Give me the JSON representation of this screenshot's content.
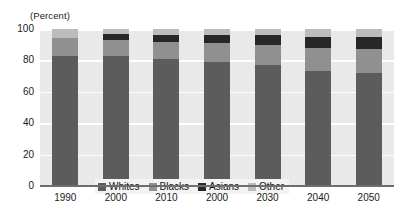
{
  "chart_data": {
    "type": "bar",
    "stacked": true,
    "title": "",
    "subtitle": "",
    "xlabel": "",
    "ylabel": "(Percent)",
    "ylim": [
      0,
      100
    ],
    "yticks": [
      0,
      20,
      40,
      60,
      80,
      100
    ],
    "ytick_labels": [
      "0",
      "20",
      "40",
      "60",
      "80",
      "100"
    ],
    "grid": "horizontal",
    "legend_position": "inside-lower-left",
    "categories": [
      "1990",
      "2000",
      "2010",
      "2000",
      "2030",
      "2040",
      "2050"
    ],
    "series": [
      {
        "name": "Whites",
        "color": "#5c5c5c",
        "values": [
          83,
          83,
          81,
          79,
          77,
          73,
          72
        ]
      },
      {
        "name": "Blacks",
        "color": "#909090",
        "values": [
          11,
          10,
          11,
          12,
          13,
          15,
          15
        ]
      },
      {
        "name": "Asians",
        "color": "#272727",
        "values": [
          0,
          4,
          4,
          5,
          6,
          7,
          8
        ]
      },
      {
        "name": "Other",
        "color": "#bcbcbc",
        "values": [
          6,
          3,
          4,
          4,
          4,
          5,
          5
        ]
      }
    ]
  },
  "axis": {
    "unit_caption": "(Percent)"
  },
  "legend": {
    "entries": [
      {
        "label": "Whites",
        "color": "#5c5c5c"
      },
      {
        "label": "Blacks",
        "color": "#909090"
      },
      {
        "label": "Asians",
        "color": "#272727"
      },
      {
        "label": "Other",
        "color": "#bcbcbc"
      }
    ]
  },
  "colors": {
    "panel_background": "#e9e9e9",
    "gridline": "#ffffff",
    "axis_line": "#6e6e6e",
    "text": "#1a1a1a",
    "legend_background": "#f3f3f3"
  }
}
